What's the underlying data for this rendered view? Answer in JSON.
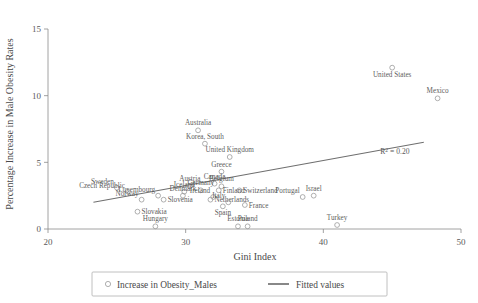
{
  "chart_data": {
    "type": "scatter",
    "title": "",
    "xlabel": "Gini Index",
    "ylabel": "Percentage Increase in Male Obesity Rates",
    "xlim": [
      20,
      50
    ],
    "ylim": [
      0,
      15
    ],
    "xticks": [
      20,
      30,
      40,
      50
    ],
    "yticks": [
      0,
      5,
      10,
      15
    ],
    "grid": false,
    "legend_position": "bottom",
    "annotations": [
      {
        "text": "R2 = 0.20",
        "x": 45.2,
        "y": 5.6
      }
    ],
    "series": [
      {
        "name": "Increase in Obesity_Males",
        "marker": "open-circle",
        "points": [
          {
            "label": "United States",
            "x": 45.0,
            "y": 12.1,
            "label_pos": "below"
          },
          {
            "label": "Mexico",
            "x": 48.3,
            "y": 9.8,
            "label_pos": "above"
          },
          {
            "label": "Australia",
            "x": 30.9,
            "y": 7.4,
            "label_pos": "above"
          },
          {
            "label": "Korea, South",
            "x": 31.4,
            "y": 6.4,
            "label_pos": "above"
          },
          {
            "label": "United Kingdom",
            "x": 33.2,
            "y": 5.4,
            "label_pos": "above"
          },
          {
            "label": "Greece",
            "x": 32.6,
            "y": 4.3,
            "label_pos": "above"
          },
          {
            "label": "Canada",
            "x": 32.1,
            "y": 3.4,
            "label_pos": "above"
          },
          {
            "label": "Switzerland",
            "x": 33.9,
            "y": 2.9,
            "label_pos": "right"
          },
          {
            "label": "Israel",
            "x": 39.3,
            "y": 2.5,
            "label_pos": "above"
          },
          {
            "label": "Portugal",
            "x": 38.5,
            "y": 2.4,
            "label_pos": "above-left"
          },
          {
            "label": "Sweden",
            "x": 25.0,
            "y": 3.1,
            "label_pos": "above-left"
          },
          {
            "label": "Austria",
            "x": 30.3,
            "y": 3.2,
            "label_pos": "above"
          },
          {
            "label": "Belgium",
            "x": 32.6,
            "y": 3.2,
            "label_pos": "above"
          },
          {
            "label": "Germany",
            "x": 31.1,
            "y": 2.9,
            "label_pos": "above"
          },
          {
            "label": "Czech Republic",
            "x": 25.8,
            "y": 2.8,
            "label_pos": "above-left"
          },
          {
            "label": "Iceland",
            "x": 29.9,
            "y": 2.8,
            "label_pos": "above"
          },
          {
            "label": "Finland",
            "x": 32.4,
            "y": 2.9,
            "label_pos": "right"
          },
          {
            "label": "Luxembourg",
            "x": 28.0,
            "y": 2.5,
            "label_pos": "above-left"
          },
          {
            "label": "Denmark",
            "x": 29.8,
            "y": 2.5,
            "label_pos": "above"
          },
          {
            "label": "Norway",
            "x": 26.8,
            "y": 2.2,
            "label_pos": "above-left"
          },
          {
            "label": "Slovenia",
            "x": 28.4,
            "y": 2.2,
            "label_pos": "right"
          },
          {
            "label": "Ireland",
            "x": 32.0,
            "y": 2.4,
            "label_pos": "above-left"
          },
          {
            "label": "Netherlands",
            "x": 31.8,
            "y": 2.2,
            "label_pos": "right"
          },
          {
            "label": "Italy",
            "x": 33.1,
            "y": 2.0,
            "label_pos": "above-left"
          },
          {
            "label": "Spain",
            "x": 32.7,
            "y": 1.7,
            "label_pos": "below"
          },
          {
            "label": "France",
            "x": 34.3,
            "y": 1.8,
            "label_pos": "right"
          },
          {
            "label": "Slovakia",
            "x": 26.5,
            "y": 1.3,
            "label_pos": "right"
          },
          {
            "label": "Hungary",
            "x": 27.8,
            "y": 0.2,
            "label_pos": "above"
          },
          {
            "label": "Estonia",
            "x": 33.8,
            "y": 0.2,
            "label_pos": "above"
          },
          {
            "label": "Poland",
            "x": 34.5,
            "y": 0.2,
            "label_pos": "above"
          },
          {
            "label": "Turkey",
            "x": 41.0,
            "y": 0.3,
            "label_pos": "above"
          }
        ]
      }
    ],
    "fitted_line": {
      "name": "Fitted values",
      "x_start": 23.3,
      "y_start": 2.0,
      "x_end": 47.3,
      "y_end": 6.5
    }
  },
  "legend": {
    "entries": [
      {
        "label": "Increase in Obesity_Males",
        "marker": "open-circle"
      },
      {
        "label": "Fitted values",
        "marker": "line"
      }
    ]
  },
  "colors": {
    "axis": "#8a8a8a",
    "marker": "#9a9a9a",
    "fit_line": "#6f6f6f",
    "text": "#4a4a4a",
    "legend_border": "#b0b0b0",
    "background": "#ffffff"
  }
}
